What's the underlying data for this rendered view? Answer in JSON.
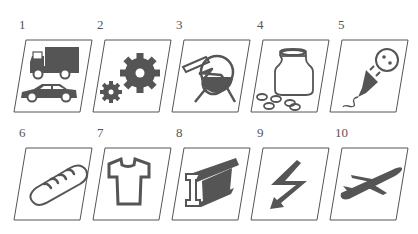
{
  "figure": {
    "style": {
      "icon_color": "#555555",
      "frame_color": "#555555",
      "background": "#ffffff"
    },
    "tiles": [
      {
        "number": "1",
        "icon": "truck-and-car-icon",
        "meaning": "transport"
      },
      {
        "number": "2",
        "icon": "gears-icon",
        "meaning": "machinery"
      },
      {
        "number": "3",
        "icon": "flask-icon",
        "meaning": "chemicals"
      },
      {
        "number": "4",
        "icon": "jar-and-pills-icon",
        "meaning": "pharmaceuticals"
      },
      {
        "number": "5",
        "icon": "plug-and-socket-icon",
        "meaning": "electrical equipment"
      },
      {
        "number": "6",
        "icon": "bread-icon",
        "meaning": "food"
      },
      {
        "number": "7",
        "icon": "tshirt-icon",
        "meaning": "textiles"
      },
      {
        "number": "8",
        "icon": "steel-beam-icon",
        "meaning": "metals"
      },
      {
        "number": "9",
        "icon": "lightning-bolt-icon",
        "meaning": "energy"
      },
      {
        "number": "10",
        "icon": "airplane-icon",
        "meaning": "aviation"
      }
    ]
  }
}
